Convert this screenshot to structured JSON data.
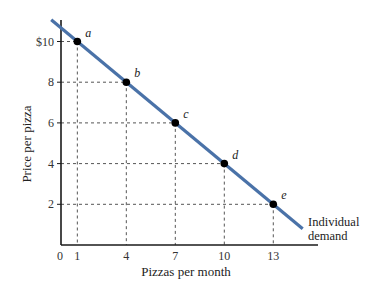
{
  "chart_data": {
    "type": "line",
    "title": "",
    "xlabel": "Pizzas per month",
    "ylabel": "Price per pizza",
    "x_ticks": [
      0,
      1,
      4,
      7,
      10,
      13
    ],
    "x_tick_labels": [
      "0",
      "1",
      "4",
      "7",
      "10",
      "13"
    ],
    "y_ticks": [
      2,
      4,
      6,
      8,
      10
    ],
    "y_tick_labels": [
      "2",
      "4",
      "6",
      "8",
      "$10"
    ],
    "xlim": [
      0,
      16
    ],
    "ylim": [
      0,
      11
    ],
    "grid": false,
    "guide_lines": "dashed from each point to both axes",
    "series": [
      {
        "name": "Individual demand",
        "color": "#4a72a8",
        "points": [
          {
            "label": "a",
            "x": 1,
            "y": 10
          },
          {
            "label": "b",
            "x": 4,
            "y": 8
          },
          {
            "label": "c",
            "x": 7,
            "y": 6
          },
          {
            "label": "d",
            "x": 10,
            "y": 4
          },
          {
            "label": "e",
            "x": 13,
            "y": 2
          }
        ],
        "line_extent": {
          "x_start": -0.6,
          "y_start": 11.07,
          "x_end": 14.8,
          "y_end": 0.8
        }
      }
    ],
    "annotations": [
      {
        "text": "Individual",
        "line": 1
      },
      {
        "text": "demand",
        "line": 2
      }
    ]
  },
  "labels": {
    "xlabel": "Pizzas per month",
    "ylabel": "Price per pizza",
    "curve_line1": "Individual",
    "curve_line2": "demand"
  },
  "colors": {
    "curve": "#4a72a8",
    "axis": "#1a1a1a",
    "guide": "#555555",
    "point": "#000000"
  }
}
